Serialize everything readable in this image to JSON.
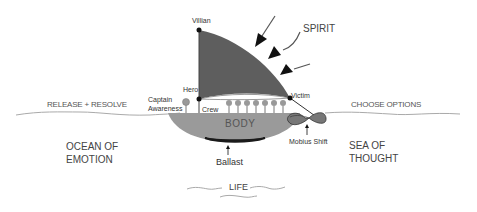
{
  "diagram": {
    "nodes": {
      "villain": "Villian",
      "hero": "Hero",
      "victim": "Victim",
      "spirit": "SPIRIT",
      "captain_line1": "Captain",
      "captain_line2": "Awareness",
      "crew": "Crew",
      "body": "BODY",
      "ballast": "Ballast",
      "mobius": "Mobius Shift",
      "life": "LIFE"
    },
    "regions": {
      "release": "RELEASE + RESOLVE",
      "choose": "CHOOSE OPTIONS",
      "ocean_line1": "OCEAN OF",
      "ocean_line2": "EMOTION",
      "sea_line1": "SEA OF",
      "sea_line2": "THOUGHT"
    },
    "colors": {
      "sail": "#5e5e5e",
      "hull": "#9a9a9a",
      "hull_bottom": "#1a1a1a",
      "water_line": "#aaaaaa",
      "node": "#111111"
    },
    "crew_count": 7
  }
}
